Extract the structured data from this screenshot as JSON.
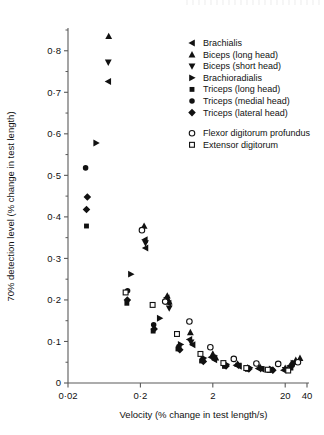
{
  "figure": {
    "background": "#ffffff",
    "ink_color": "#111111",
    "axis_color": "#5a5a5a"
  },
  "chart_data": {
    "type": "scatter",
    "title": "",
    "subtitle": "",
    "xlabel": "Velocity (% change in test length/s)",
    "ylabel": "70% detection level (% change in test length)",
    "xscale": "log",
    "yscale": "linear",
    "xlim": [
      0.02,
      40
    ],
    "ylim": [
      0,
      0.85
    ],
    "grid": false,
    "legend_position": "upper-right",
    "xticks": [
      0.02,
      0.2,
      2,
      20,
      40
    ],
    "xtick_labels": [
      "0·02",
      "0·2",
      "2",
      "20",
      "40"
    ],
    "yticks": [
      0,
      0.1,
      0.2,
      0.3,
      0.4,
      0.5,
      0.6,
      0.7,
      0.8
    ],
    "ytick_labels": [
      "0",
      "0·1",
      "0·2",
      "0·3",
      "0·4",
      "0·5",
      "0·6",
      "0·7",
      "0·8"
    ],
    "yticks_minor": [
      0.05,
      0.15,
      0.25,
      0.35,
      0.45,
      0.55,
      0.65,
      0.75,
      0.85
    ],
    "series": [
      {
        "name": "Brachialis",
        "marker": "triangle-left",
        "filled": true,
        "points": [
          [
            0.072,
            0.726
          ],
          [
            0.23,
            0.345
          ],
          [
            0.235,
            0.325
          ],
          [
            0.46,
            0.205
          ],
          [
            0.49,
            0.192
          ],
          [
            0.95,
            0.105
          ],
          [
            1.05,
            0.092
          ],
          [
            1.9,
            0.062
          ],
          [
            2.1,
            0.056
          ],
          [
            4.2,
            0.043
          ],
          [
            4.6,
            0.04
          ],
          [
            8.5,
            0.035
          ],
          [
            9.5,
            0.033
          ],
          [
            19,
            0.031
          ],
          [
            23,
            0.041
          ]
        ]
      },
      {
        "name": "Biceps (long head)",
        "marker": "triangle-up",
        "filled": true,
        "points": [
          [
            0.073,
            0.835
          ],
          [
            0.225,
            0.378
          ],
          [
            0.47,
            0.21
          ],
          [
            0.5,
            0.196
          ],
          [
            0.98,
            0.122
          ],
          [
            2.0,
            0.07
          ],
          [
            2.2,
            0.061
          ],
          [
            4.4,
            0.046
          ],
          [
            9.0,
            0.038
          ],
          [
            20,
            0.036
          ],
          [
            28,
            0.055
          ],
          [
            32,
            0.06
          ]
        ]
      },
      {
        "name": "Biceps (short head)",
        "marker": "triangle-down",
        "filled": true,
        "points": [
          [
            0.072,
            0.772
          ],
          [
            0.235,
            0.337
          ],
          [
            0.5,
            0.18
          ],
          [
            1.0,
            0.098
          ],
          [
            2.1,
            0.06
          ],
          [
            4.5,
            0.042
          ],
          [
            9.2,
            0.034
          ],
          [
            20,
            0.032
          ]
        ]
      },
      {
        "name": "Brachioradialis",
        "marker": "triangle-right",
        "filled": true,
        "points": [
          [
            0.049,
            0.578
          ],
          [
            0.148,
            0.262
          ],
          [
            0.37,
            0.156
          ],
          [
            0.72,
            0.093
          ],
          [
            1.5,
            0.06
          ],
          [
            3.1,
            0.045
          ],
          [
            6.5,
            0.037
          ],
          [
            13,
            0.034
          ],
          [
            26,
            0.048
          ]
        ]
      },
      {
        "name": "Triceps (long head)",
        "marker": "square",
        "filled": true,
        "points": [
          [
            0.036,
            0.378
          ],
          [
            0.13,
            0.192
          ],
          [
            0.3,
            0.125
          ],
          [
            0.66,
            0.082
          ],
          [
            1.4,
            0.053
          ],
          [
            2.9,
            0.04
          ],
          [
            6.0,
            0.033
          ],
          [
            12,
            0.03
          ],
          [
            24,
            0.036
          ]
        ]
      },
      {
        "name": "Triceps (medial head)",
        "marker": "circle",
        "filled": true,
        "points": [
          [
            0.035,
            0.518
          ],
          [
            0.133,
            0.222
          ],
          [
            0.305,
            0.14
          ],
          [
            0.68,
            0.088
          ],
          [
            1.45,
            0.057
          ],
          [
            3.0,
            0.042
          ],
          [
            6.2,
            0.035
          ],
          [
            12.5,
            0.032
          ],
          [
            25,
            0.043
          ]
        ]
      },
      {
        "name": "Triceps (lateral head)",
        "marker": "diamond",
        "filled": true,
        "points": [
          [
            0.037,
            0.448
          ],
          [
            0.036,
            0.418
          ],
          [
            0.132,
            0.2
          ],
          [
            0.31,
            0.13
          ],
          [
            0.7,
            0.08
          ],
          [
            1.48,
            0.052
          ],
          [
            3.05,
            0.041
          ],
          [
            6.3,
            0.034
          ],
          [
            13.5,
            0.031
          ],
          [
            25.5,
            0.047
          ]
        ]
      },
      {
        "name": "Flexor digitorum profundus",
        "marker": "circle",
        "filled": false,
        "points": [
          [
            0.21,
            0.368
          ],
          [
            0.44,
            0.196
          ],
          [
            0.95,
            0.148
          ],
          [
            1.85,
            0.086
          ],
          [
            3.9,
            0.058
          ],
          [
            8.0,
            0.047
          ],
          [
            16,
            0.046
          ],
          [
            30,
            0.05
          ]
        ]
      },
      {
        "name": "Extensor digitorum",
        "marker": "square",
        "filled": false,
        "points": [
          [
            0.125,
            0.218
          ],
          [
            0.295,
            0.188
          ],
          [
            0.64,
            0.118
          ],
          [
            1.35,
            0.07
          ],
          [
            2.8,
            0.048
          ],
          [
            5.8,
            0.036
          ],
          [
            11.5,
            0.032
          ],
          [
            22,
            0.03
          ]
        ]
      }
    ],
    "legend_groups": [
      {
        "id": "muscles-upper-arm",
        "entries": [
          {
            "label": "Brachialis",
            "marker": "triangle-left",
            "filled": true
          },
          {
            "label": "Biceps (long head)",
            "marker": "triangle-up",
            "filled": true
          },
          {
            "label": "Biceps (short head)",
            "marker": "triangle-down",
            "filled": true
          },
          {
            "label": "Brachioradialis",
            "marker": "triangle-right",
            "filled": true
          },
          {
            "label": "Triceps (long head)",
            "marker": "square",
            "filled": true
          },
          {
            "label": "Triceps (medial head)",
            "marker": "circle",
            "filled": true
          },
          {
            "label": "Triceps (lateral head)",
            "marker": "diamond",
            "filled": true
          }
        ]
      },
      {
        "id": "muscles-forearm",
        "entries": [
          {
            "label": "Flexor digitorum profundus",
            "marker": "circle",
            "filled": false
          },
          {
            "label": "Extensor digitorum",
            "marker": "square",
            "filled": false
          }
        ]
      }
    ]
  }
}
